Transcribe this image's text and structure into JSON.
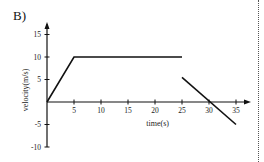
{
  "panel_label": "B)",
  "chart_data": {
    "type": "line",
    "title": "",
    "xlabel": "time(s)",
    "ylabel": "velocity(m/s)",
    "xlim": [
      0,
      36
    ],
    "ylim": [
      -10,
      16
    ],
    "x_ticks": [
      5,
      10,
      15,
      20,
      25,
      30,
      35
    ],
    "y_ticks": [
      15,
      10,
      5,
      -5,
      -10
    ],
    "grid": false,
    "legend": null,
    "series": [
      {
        "name": "segment-1",
        "points": [
          [
            0,
            0
          ],
          [
            5,
            10
          ],
          [
            25,
            10
          ]
        ]
      },
      {
        "name": "segment-2",
        "points": [
          [
            25,
            5.5
          ],
          [
            35,
            -5
          ]
        ]
      }
    ],
    "line_color": "#111111"
  }
}
